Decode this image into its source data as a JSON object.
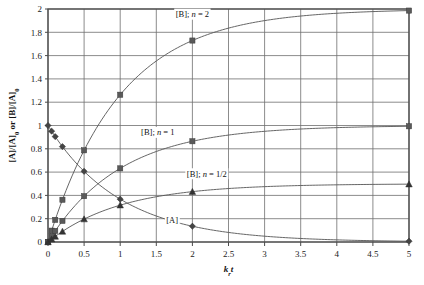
{
  "chart_data": {
    "type": "line",
    "title": "",
    "xlabel": "k_r t",
    "ylabel": "[A]/[A]0 or [B]/[A]0",
    "xlim": [
      0,
      5
    ],
    "ylim": [
      0,
      2
    ],
    "xticks": [
      "0",
      "0.5",
      "1",
      "1.5",
      "2",
      "2.5",
      "3",
      "3.5",
      "4",
      "4.5",
      "5"
    ],
    "xtick_values": [
      0,
      0.5,
      1,
      1.5,
      2,
      2.5,
      3,
      3.5,
      4,
      4.5,
      5
    ],
    "yticks": [
      "0",
      "0.2",
      "0.4",
      "0.6",
      "0.8",
      "1",
      "1.2",
      "1.4",
      "1.6",
      "1.8",
      "2"
    ],
    "ytick_values": [
      0,
      0.2,
      0.4,
      0.6,
      0.8,
      1,
      1.2,
      1.4,
      1.6,
      1.8,
      2
    ],
    "grid": true,
    "legend_position": "inline-annotations",
    "x": [
      0,
      0.05,
      0.1,
      0.2,
      0.5,
      1,
      2,
      5
    ],
    "series": [
      {
        "name": "[B]; n = 2",
        "marker": "square",
        "color": "#595959",
        "values": [
          0,
          0.0975,
          0.19,
          0.3625,
          0.7869,
          1.2642,
          1.7293,
          1.9865
        ]
      },
      {
        "name": "[B]; n = 1",
        "marker": "square",
        "color": "#595959",
        "values": [
          0,
          0.0488,
          0.0952,
          0.1813,
          0.3935,
          0.6321,
          0.8647,
          0.9933
        ]
      },
      {
        "name": "[B]; n = 1/2",
        "marker": "triangle",
        "color": "#333333",
        "values": [
          0,
          0.0244,
          0.0476,
          0.0906,
          0.1967,
          0.3161,
          0.4323,
          0.4966
        ]
      },
      {
        "name": "[A]",
        "marker": "diamond",
        "color": "#444444",
        "values": [
          1,
          0.9512,
          0.9048,
          0.8187,
          0.6065,
          0.3679,
          0.1353,
          0.0067
        ]
      }
    ],
    "annotations": [
      {
        "name": "[B]; n = 2",
        "label_plain": "[B]; ",
        "label_italic": "n",
        "label_tail": " = 2",
        "x": 2.0,
        "y": 1.93
      },
      {
        "name": "[B]; n = 1",
        "label_plain": "[B]; ",
        "label_italic": "n",
        "label_tail": " = 1",
        "x": 1.52,
        "y": 0.915
      },
      {
        "name": "[B]; n = 1/2",
        "label_plain": "[B]; ",
        "label_italic": "n",
        "label_tail": " = 1/2",
        "x": 2.2,
        "y": 0.56
      },
      {
        "name": "[A]",
        "label_plain": "[A]",
        "label_italic": "",
        "label_tail": "",
        "x": 1.72,
        "y": 0.165
      }
    ],
    "colors": {
      "grid": "#6f6f6f",
      "axis": "#4a4a4a",
      "curve": "#555555",
      "background": "#ffffff"
    }
  },
  "ylabel_parts": {
    "a": "[A]/[A]",
    "a_sub": "0",
    "mid": " or [B]/[A]",
    "b_sub": "0"
  },
  "xlabel_parts": {
    "k": "k",
    "k_sub": "r",
    "t": "t"
  }
}
